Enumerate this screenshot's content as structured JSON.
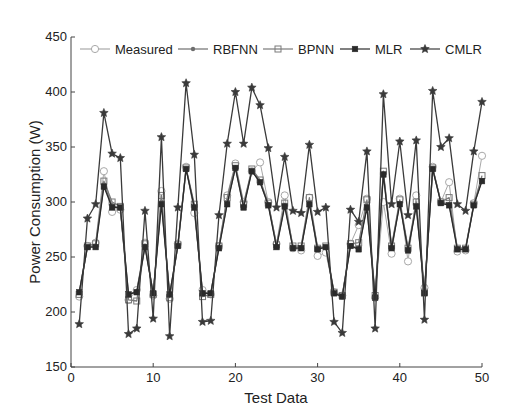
{
  "chart_data": {
    "type": "line",
    "title": "",
    "xlabel": "Test Data",
    "ylabel": "Power Consumption (W)",
    "xlim": [
      0,
      50
    ],
    "ylim": [
      150,
      450
    ],
    "xticks": [
      0,
      10,
      20,
      30,
      40,
      50
    ],
    "yticks": [
      150,
      200,
      250,
      300,
      350,
      400,
      450
    ],
    "grid": false,
    "legend_position": "top (inside, horizontal)",
    "x": [
      1,
      2,
      3,
      4,
      5,
      6,
      7,
      8,
      9,
      10,
      11,
      12,
      13,
      14,
      15,
      16,
      17,
      18,
      19,
      20,
      21,
      22,
      23,
      24,
      25,
      26,
      27,
      28,
      29,
      30,
      31,
      32,
      33,
      34,
      35,
      36,
      37,
      38,
      39,
      40,
      41,
      42,
      43,
      44,
      45,
      46,
      47,
      48,
      49,
      50
    ],
    "series": [
      {
        "name": "Measured",
        "marker": "circle-open",
        "color": "#a8a8a8",
        "values": [
          214,
          260,
          263,
          328,
          291,
          293,
          211,
          220,
          263,
          215,
          310,
          212,
          262,
          332,
          290,
          220,
          216,
          260,
          306,
          335,
          300,
          328,
          336,
          300,
          262,
          306,
          258,
          256,
          304,
          251,
          254,
          218,
          215,
          262,
          279,
          303,
          213,
          300,
          253,
          303,
          246,
          306,
          222,
          332,
          300,
          318,
          255,
          256,
          299,
          342
        ]
      },
      {
        "name": "RBFNN",
        "marker": "dot",
        "color": "#6e6e6e",
        "values": [
          218,
          259,
          260,
          316,
          297,
          294,
          216,
          219,
          260,
          217,
          300,
          216,
          260,
          330,
          296,
          218,
          217,
          259,
          299,
          331,
          296,
          328,
          318,
          298,
          260,
          297,
          259,
          259,
          299,
          258,
          259,
          217,
          215,
          260,
          258,
          296,
          214,
          326,
          259,
          299,
          257,
          297,
          218,
          330,
          300,
          298,
          258,
          258,
          297,
          320
        ]
      },
      {
        "name": "BPNN",
        "marker": "square-open",
        "color": "#7a7a7a",
        "values": [
          216,
          260,
          262,
          319,
          300,
          296,
          211,
          210,
          262,
          216,
          306,
          213,
          261,
          331,
          298,
          214,
          216,
          260,
          304,
          333,
          298,
          330,
          320,
          299,
          261,
          299,
          260,
          260,
          304,
          258,
          260,
          218,
          215,
          262,
          263,
          302,
          215,
          328,
          260,
          302,
          258,
          300,
          218,
          331,
          300,
          304,
          258,
          258,
          298,
          324
        ]
      },
      {
        "name": "MLR",
        "marker": "square-filled",
        "color": "#2a2a2a",
        "values": [
          218,
          259,
          259,
          314,
          295,
          295,
          216,
          218,
          259,
          217,
          298,
          216,
          260,
          330,
          295,
          217,
          217,
          258,
          298,
          331,
          295,
          328,
          318,
          297,
          259,
          296,
          258,
          258,
          298,
          257,
          259,
          217,
          214,
          260,
          257,
          295,
          213,
          325,
          258,
          298,
          256,
          296,
          217,
          330,
          299,
          297,
          257,
          257,
          297,
          319
        ]
      },
      {
        "name": "CMLR",
        "marker": "star",
        "color": "#3a3a3a",
        "values": [
          189,
          285,
          298,
          381,
          344,
          340,
          180,
          185,
          292,
          194,
          359,
          178,
          295,
          408,
          343,
          191,
          192,
          288,
          353,
          400,
          353,
          404,
          388,
          349,
          295,
          341,
          292,
          290,
          352,
          291,
          295,
          191,
          181,
          293,
          282,
          346,
          185,
          398,
          298,
          355,
          288,
          356,
          193,
          401,
          350,
          358,
          298,
          292,
          346,
          391
        ]
      }
    ]
  },
  "legend": {
    "items": [
      {
        "label": "Measured"
      },
      {
        "label": "RBFNN"
      },
      {
        "label": "BPNN"
      },
      {
        "label": "MLR"
      },
      {
        "label": "CMLR"
      }
    ]
  },
  "axes": {
    "xlabel": "Test Data",
    "ylabel": "Power Consumption (W)"
  }
}
